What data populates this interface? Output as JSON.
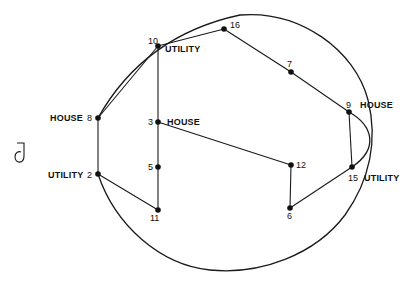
{
  "figure": {
    "side_glyph": "ට",
    "side_glyph_fallback": "J",
    "nodes": [
      {
        "id": "16",
        "x": 224,
        "y": 29,
        "number": "16",
        "tag": ""
      },
      {
        "id": "10",
        "x": 158,
        "y": 46,
        "number": "10",
        "tag": "UTILITY"
      },
      {
        "id": "7",
        "x": 291,
        "y": 72,
        "number": "7",
        "tag": ""
      },
      {
        "id": "8",
        "x": 98,
        "y": 118,
        "number": "8",
        "tag": "HOUSE"
      },
      {
        "id": "9",
        "x": 349,
        "y": 112,
        "number": "9",
        "tag": "HOUSE"
      },
      {
        "id": "3",
        "x": 158,
        "y": 122,
        "number": "3",
        "tag": "HOUSE"
      },
      {
        "id": "5",
        "x": 158,
        "y": 167,
        "number": "5",
        "tag": ""
      },
      {
        "id": "12",
        "x": 291,
        "y": 165,
        "number": "12",
        "tag": ""
      },
      {
        "id": "2",
        "x": 98,
        "y": 174,
        "number": "2",
        "tag": "UTILITY"
      },
      {
        "id": "15",
        "x": 352,
        "y": 167,
        "number": "15",
        "tag": "UTILITY"
      },
      {
        "id": "11",
        "x": 158,
        "y": 210,
        "number": "11",
        "tag": ""
      },
      {
        "id": "6",
        "x": 290,
        "y": 208,
        "number": "6",
        "tag": ""
      }
    ],
    "edges": [
      [
        "8",
        "10"
      ],
      [
        "10",
        "16"
      ],
      [
        "16",
        "7"
      ],
      [
        "7",
        "9"
      ],
      [
        "9",
        "15"
      ],
      [
        "15",
        "6"
      ],
      [
        "6",
        "12"
      ],
      [
        "12",
        "3"
      ],
      [
        "10",
        "3"
      ],
      [
        "3",
        "5"
      ],
      [
        "5",
        "11"
      ],
      [
        "11",
        "2"
      ],
      [
        "2",
        "8"
      ]
    ],
    "curved_edges": [
      {
        "from": "8",
        "to": "2",
        "route": "outer loop over top, right side, bottom"
      },
      {
        "from": "9",
        "to": "15",
        "route": "bulge right"
      }
    ],
    "labels": {
      "n16": "16",
      "n10": "10",
      "n10_tag": "UTILITY",
      "n7": "7",
      "n8_tag": "HOUSE",
      "n8": "8",
      "n9": "9",
      "n9_tag": "HOUSE",
      "n3": "3",
      "n3_tag": "HOUSE",
      "n5": "5",
      "n12": "12",
      "n2_tag": "UTILITY",
      "n2": "2",
      "n15": "15",
      "n15_tag": "UTILITY",
      "n11": "11",
      "n6": "6",
      "side_mark": "ට"
    }
  }
}
